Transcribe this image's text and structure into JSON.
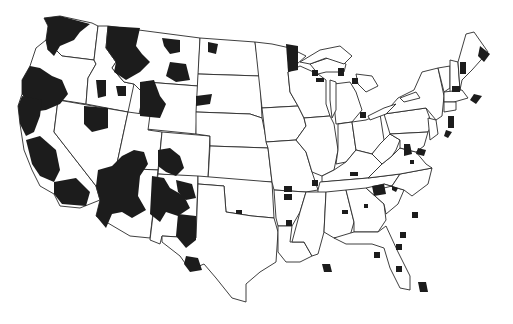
{
  "map": {
    "title": "",
    "background": "#ffffff",
    "fill_color": "#1c1c1c",
    "outline_color": "#2a2a2a",
    "subject": "Contiguous United States with shaded areas",
    "legend": null,
    "states": [
      {
        "name": "Washington",
        "d": "M44,18 L60,16 L92,23 L98,26 L94,60 L62,56 L56,50 L48,50 L46,40 L48,26 Z"
      },
      {
        "name": "Oregon",
        "d": "M46,40 L48,50 L56,50 L62,56 L94,60 L96,64 L88,78 L86,104 L22,94 L22,80 L30,66 L36,48 Z"
      },
      {
        "name": "California",
        "d": "M22,94 L58,100 L54,132 L96,186 L100,200 L80,208 L60,206 L54,194 L40,186 L32,170 L24,150 L20,124 L18,106 Z"
      },
      {
        "name": "Idaho",
        "d": "M98,26 L108,26 L106,48 L116,62 L112,68 L124,82 L134,84 L128,112 L86,104 L88,78 L96,64 L94,60 Z"
      },
      {
        "name": "Nevada",
        "d": "M58,100 L128,112 L116,168 L106,170 L104,188 L96,186 L54,132 Z"
      },
      {
        "name": "Montana",
        "d": "M108,26 L200,38 L198,86 L146,82 L140,90 L134,84 L124,82 L112,68 L116,62 L106,48 Z"
      },
      {
        "name": "Wyoming",
        "d": "M146,82 L198,86 L196,134 L136,128 Z"
      },
      {
        "name": "Utah",
        "d": "M128,112 L150,115 L148,130 L162,132 L158,170 L116,168 Z"
      },
      {
        "name": "Arizona",
        "d": "M116,168 L158,170 L150,238 L130,236 L96,216 L100,200 L96,186 L104,188 L106,170 Z"
      },
      {
        "name": "Colorado",
        "d": "M162,132 L210,136 L208,178 L158,174 Z"
      },
      {
        "name": "New Mexico",
        "d": "M158,174 L198,176 L196,238 L162,236 L160,244 L150,240 Z"
      },
      {
        "name": "North Dakota",
        "d": "M200,38 L255,42 L260,76 L198,74 Z"
      },
      {
        "name": "South Dakota",
        "d": "M198,74 L260,76 L262,118 L250,114 L196,112 Z"
      },
      {
        "name": "Nebraska",
        "d": "M196,112 L250,114 L262,118 L268,148 L210,146 L210,136 L196,134 Z"
      },
      {
        "name": "Kansas",
        "d": "M210,146 L268,148 L272,182 L208,180 Z"
      },
      {
        "name": "Oklahoma",
        "d": "M198,176 L272,182 L274,218 L252,216 L226,212 L224,186 L198,184 Z"
      },
      {
        "name": "Texas",
        "d": "M198,184 L224,186 L226,212 L252,216 L274,218 L278,232 L276,262 L260,272 L246,284 L246,302 L232,298 L216,278 L204,264 L190,270 L180,256 L162,242 L162,236 L196,238 Z"
      },
      {
        "name": "Minnesota",
        "d": "M255,42 L272,44 L290,48 L306,56 L288,72 L290,92 L298,106 L262,108 Z"
      },
      {
        "name": "Iowa",
        "d": "M262,108 L298,106 L304,118 L306,126 L296,140 L266,142 Z"
      },
      {
        "name": "Missouri",
        "d": "M266,142 L296,140 L306,152 L312,172 L318,190 L306,192 L274,190 L272,182 L268,148 Z"
      },
      {
        "name": "Arkansas",
        "d": "M274,190 L306,192 L300,212 L292,226 L278,226 L276,218 Z"
      },
      {
        "name": "Louisiana",
        "d": "M278,226 L292,226 L290,242 L304,242 L312,256 L300,262 L286,262 L278,252 Z"
      },
      {
        "name": "Wisconsin",
        "d": "M288,72 L300,66 L318,74 L326,80 L326,104 L330,116 L304,118 L298,106 L290,92 Z"
      },
      {
        "name": "Illinois",
        "d": "M304,118 L330,116 L334,124 L338,150 L334,170 L322,176 L312,172 L306,152 L296,140 L306,126 Z"
      },
      {
        "name": "Michigan",
        "d": "M334,84 L350,82 L356,92 L362,110 L352,122 L336,124 L334,104 Z"
      },
      {
        "name": "Upper Michigan",
        "d": "M310,64 L328,58 L346,64 L344,72 L326,72 L318,74 Z"
      },
      {
        "name": "Indiana",
        "d": "M338,124 L352,122 L356,150 L346,162 L336,164 L338,150 Z"
      },
      {
        "name": "Ohio",
        "d": "M352,122 L366,120 L380,114 L384,140 L372,154 L356,150 Z"
      },
      {
        "name": "Kentucky",
        "d": "M322,176 L334,170 L346,162 L356,150 L372,154 L382,164 L368,178 L322,182 Z"
      },
      {
        "name": "Tennessee",
        "d": "M318,190 L320,182 L368,178 L400,174 L392,186 L376,190 L318,194 Z"
      },
      {
        "name": "Mississippi",
        "d": "M306,192 L326,192 L324,232 L318,254 L312,256 L304,242 L292,242 L300,212 Z"
      },
      {
        "name": "Alabama",
        "d": "M326,192 L346,190 L354,222 L350,236 L334,238 L324,232 Z"
      },
      {
        "name": "Georgia",
        "d": "M346,190 L366,188 L384,204 L386,220 L378,232 L354,232 L354,222 Z"
      },
      {
        "name": "Florida",
        "d": "M334,238 L354,232 L378,232 L386,226 L398,252 L410,276 L410,290 L400,288 L390,268 L384,248 L372,244 L358,244 L346,244 Z"
      },
      {
        "name": "South Carolina",
        "d": "M366,188 L384,184 L404,190 L398,204 L386,214 L384,204 Z"
      },
      {
        "name": "North Carolina",
        "d": "M376,190 L392,186 L400,174 L432,168 L428,184 L412,196 L404,190 L384,184 Z"
      },
      {
        "name": "Virginia",
        "d": "M368,178 L382,164 L392,156 L400,148 L416,152 L426,164 L432,168 L400,174 Z"
      },
      {
        "name": "West Virginia",
        "d": "M380,144 L390,134 L400,140 L396,150 L392,156 L382,164 L372,154 Z"
      },
      {
        "name": "Pennsylvania",
        "d": "M384,114 L426,108 L432,124 L428,132 L390,134 Z"
      },
      {
        "name": "New York",
        "d": "M384,114 L398,98 L414,90 L422,72 L438,68 L444,96 L442,116 L436,120 L426,108 Z"
      },
      {
        "name": "Maryland",
        "d": "M390,134 L428,132 L424,146 L416,152 L400,148 L400,140 Z"
      },
      {
        "name": "New Jersey",
        "d": "M428,118 L436,120 L438,134 L430,140 Z"
      },
      {
        "name": "Vermont",
        "d": "M438,68 L450,66 L450,88 L444,92 Z"
      },
      {
        "name": "New Hampshire",
        "d": "M450,60 L458,62 L460,90 L450,92 Z"
      },
      {
        "name": "Maine",
        "d": "M458,62 L466,34 L474,32 L488,52 L472,70 L462,80 L460,90 Z"
      },
      {
        "name": "Massachusetts",
        "d": "M444,92 L462,90 L468,98 L454,102 L444,102 Z"
      },
      {
        "name": "Connecticut",
        "d": "M444,102 L456,102 L456,110 L444,112 Z"
      }
    ],
    "lakes": [
      {
        "name": "Lake Superior",
        "d": "M300,62 L320,50 L340,46 L352,56 L344,64 L326,58 L310,64 Z"
      },
      {
        "name": "Lake Michigan",
        "d": "M330,80 L336,82 L336,110 L332,118 L330,100 Z"
      },
      {
        "name": "Lake Huron",
        "d": "M356,74 L372,76 L378,86 L366,92 L358,84 Z"
      },
      {
        "name": "Lake Erie",
        "d": "M368,116 L384,108 L396,104 L386,114 L370,120 Z"
      },
      {
        "name": "Lake Ontario",
        "d": "M400,98 L416,92 L420,98 L404,102 Z"
      }
    ],
    "regions": [
      {
        "name": "wa-west",
        "d": "M44,18 L60,16 L90,24 L80,32 L74,40 L60,46 L54,56 L48,50 L46,40 L48,26 Z"
      },
      {
        "name": "or-west",
        "d": "M30,66 L40,68 L52,76 L62,80 L68,94 L60,104 L46,110 L32,112 L22,94 L22,80 Z"
      },
      {
        "name": "ca-north",
        "d": "M22,96 L42,100 L40,116 L34,132 L26,136 L20,124 L18,106 Z"
      },
      {
        "name": "ca-central",
        "d": "M26,140 L40,136 L56,150 L60,170 L54,182 L40,176 L32,164 Z"
      },
      {
        "name": "ca-south",
        "d": "M54,182 L76,178 L90,192 L86,206 L62,204 L54,194 Z"
      },
      {
        "name": "id-mt-north",
        "d": "M108,26 L140,28 L136,46 L142,54 L150,62 L140,72 L126,80 L114,72 L116,62 L106,48 Z"
      },
      {
        "name": "mt-central",
        "d": "M162,38 L180,40 L180,52 L170,54 L164,46 Z"
      },
      {
        "name": "mt-east",
        "d": "M170,62 L186,64 L190,80 L176,82 L166,76 Z"
      },
      {
        "name": "nd-west",
        "d": "M208,42 L218,44 L216,54 L208,52 Z"
      },
      {
        "name": "id-spot1",
        "d": "M96,80 L106,80 L106,96 L98,98 Z"
      },
      {
        "name": "id-spot2",
        "d": "M116,86 L126,86 L126,96 L118,96 Z"
      },
      {
        "name": "wy-north",
        "d": "M140,82 L154,80 L160,96 L166,104 L160,118 L140,116 Z"
      },
      {
        "name": "sd-west",
        "d": "M196,96 L212,94 L210,104 L196,106 Z"
      },
      {
        "name": "nv-north",
        "d": "M84,106 L108,108 L108,128 L92,132 L84,124 Z"
      },
      {
        "name": "ut-az-block",
        "d": "M98,170 L112,166 L122,156 L134,150 L144,152 L148,164 L140,176 L138,196 L146,210 L132,218 L122,212 L112,214 L106,228 L96,216 L100,200 L96,186 Z"
      },
      {
        "name": "nm-co-west",
        "d": "M158,150 L170,148 L180,156 L184,168 L176,176 L166,172 L158,166 Z"
      },
      {
        "name": "nm-north",
        "d": "M152,176 L164,178 L170,188 L184,196 L190,208 L178,216 L166,212 L160,222 L150,214 Z"
      },
      {
        "name": "nm-east",
        "d": "M176,180 L192,184 L196,198 L186,200 L178,192 Z"
      },
      {
        "name": "tx-west",
        "d": "M178,214 L196,216 L196,240 L186,248 L176,236 Z"
      },
      {
        "name": "tx-big-bend",
        "d": "M186,256 L198,258 L202,270 L190,272 L184,264 Z"
      },
      {
        "name": "ok-spot",
        "d": "M236,210 L242,210 L242,214 L236,214 Z"
      },
      {
        "name": "mn-north",
        "d": "M286,44 L298,46 L298,70 L288,72 Z"
      },
      {
        "name": "wi-spot1",
        "d": "M312,70 L318,70 L318,76 L312,76 Z"
      },
      {
        "name": "wi-spot2",
        "d": "M316,78 L324,78 L324,82 L316,82 Z"
      },
      {
        "name": "mi-up",
        "d": "M338,68 L344,68 L344,76 L338,76 Z"
      },
      {
        "name": "mi-low1",
        "d": "M352,78 L358,78 L358,84 L352,84 Z"
      },
      {
        "name": "mi-low2",
        "d": "M360,112 L366,112 L366,118 L360,118 Z"
      },
      {
        "name": "me-east",
        "d": "M480,46 L490,54 L484,62 L478,56 Z"
      },
      {
        "name": "nh-spot",
        "d": "M460,62 L466,62 L466,74 L460,74 Z"
      },
      {
        "name": "vt-spot",
        "d": "M452,86 L460,86 L460,92 L452,92 Z"
      },
      {
        "name": "ma-east",
        "d": "M474,94 L482,96 L476,104 L470,100 Z"
      },
      {
        "name": "nj-spot",
        "d": "M448,116 L454,116 L454,128 L448,128 Z"
      },
      {
        "name": "de-spot",
        "d": "M446,130 L452,132 L448,138 L444,136 Z"
      },
      {
        "name": "va-west",
        "d": "M404,144 L410,144 L412,154 L404,156 Z"
      },
      {
        "name": "va-spot",
        "d": "M418,148 L426,150 L424,156 L416,154 Z"
      },
      {
        "name": "wv-spot",
        "d": "M410,160 L414,160 L414,164 L410,164 Z"
      },
      {
        "name": "ky-spot",
        "d": "M350,172 L358,172 L358,176 L350,176 Z"
      },
      {
        "name": "mo-spot1",
        "d": "M284,186 L292,186 L292,192 L284,192 Z"
      },
      {
        "name": "mo-spot2",
        "d": "M312,180 L318,180 L318,186 L312,186 Z"
      },
      {
        "name": "ar-spot1",
        "d": "M284,194 L292,194 L292,200 L284,200 Z"
      },
      {
        "name": "ar-spot2",
        "d": "M286,220 L292,220 L292,226 L286,226 Z"
      },
      {
        "name": "tn-east",
        "d": "M372,186 L384,184 L386,194 L374,196 Z"
      },
      {
        "name": "nc-spot",
        "d": "M392,186 L398,188 L396,192 L392,190 Z"
      },
      {
        "name": "al-spot",
        "d": "M342,210 L348,210 L348,214 L342,214 Z"
      },
      {
        "name": "ga-spot",
        "d": "M364,204 L368,204 L368,208 L364,208 Z"
      },
      {
        "name": "sc-spot",
        "d": "M412,212 L418,212 L418,218 L412,218 Z"
      },
      {
        "name": "ga-coast1",
        "d": "M400,232 L406,232 L406,238 L400,238 Z"
      },
      {
        "name": "ga-coast2",
        "d": "M396,244 L402,244 L402,250 L396,250 Z"
      },
      {
        "name": "la-delta",
        "d": "M322,264 L330,264 L332,272 L324,272 Z"
      },
      {
        "name": "fl-panhandle",
        "d": "M374,252 L380,252 L380,258 L374,258 Z"
      },
      {
        "name": "fl-gulf",
        "d": "M396,266 L402,266 L402,272 L396,272 Z"
      },
      {
        "name": "fl-south",
        "d": "M418,282 L426,282 L428,292 L420,292 Z"
      }
    ]
  }
}
